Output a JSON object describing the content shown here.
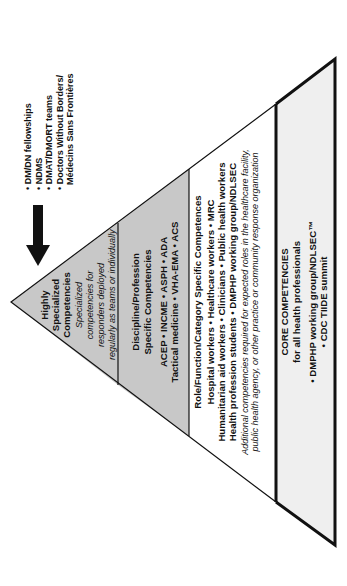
{
  "diagram": {
    "orientation": "rotated 90 degrees counterclockwise (apex left, base right)",
    "colors": {
      "tier_shaded": "#c8c8c8",
      "tier_white": "#ffffff",
      "tier_core": "#efefef",
      "stroke": "#111111"
    },
    "arrow": {
      "icon": "down-arrow-icon",
      "direction": "toward apex / highly specialized"
    },
    "external_list": {
      "items": [
        "• DM/DN fellowships",
        "• NDMS",
        "• DMAT/DMORT teams",
        "• Doctors Without Borders/",
        "  Médecins Sans Frontières"
      ]
    },
    "tiers": [
      {
        "id": "highly-specialized",
        "title_lines": [
          "Highly",
          "Specialized",
          "Competencies"
        ],
        "desc_lines": [
          "Specialized",
          "competencies for",
          "responders deployed",
          "regularly as teams or individually"
        ]
      },
      {
        "id": "discipline",
        "title_lines": [
          "Discipline/Profession",
          "Specific Competencies"
        ],
        "item_lines": [
          "ACEP • INCME • ASPH • ADA",
          "Tactical medicine • VHA-EMA • ACS"
        ]
      },
      {
        "id": "role",
        "title_lines": [
          "Role/Function/Category Specific Competences"
        ],
        "item_lines": [
          "Hospital workers • Healthcare workers • MRC",
          "Humanitarian aid workers • Clinicians • Public health workers",
          "Health profession students • DMPHP working group/NDLSEC"
        ],
        "desc_lines": [
          "Additional competencies required for expected roles in the healthcare facility,",
          "public health agency, or other practice or community response organization"
        ]
      },
      {
        "id": "core",
        "title_lines": [
          "CORE COMPETENCIES",
          "for all health professionals"
        ],
        "item_lines": [
          "• DMPHP working group/NDLSEC™",
          "• CDC TIIDE summit"
        ]
      }
    ]
  }
}
